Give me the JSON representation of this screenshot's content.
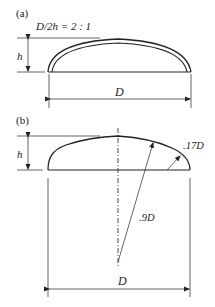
{
  "figure_a": {
    "label": "(a)",
    "ratio_text": "D/2h = 2 : 1",
    "height_label": "h",
    "diameter_label": "D"
  },
  "figure_b": {
    "label": "(b)",
    "height_label": "h",
    "crown_radius_label": ".9D",
    "knuckle_radius_label": ".17D",
    "diameter_label": "D"
  },
  "colors": {
    "line": "#222222",
    "background": "#ffffff"
  }
}
